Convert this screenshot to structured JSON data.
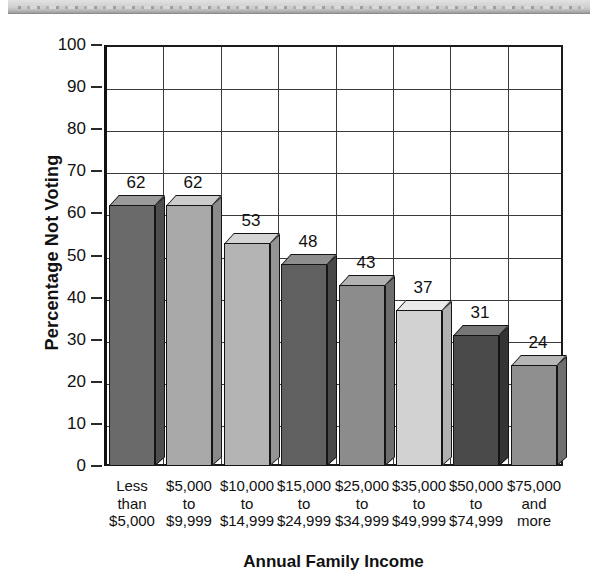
{
  "page": {
    "banner_name": "scan-artifact-banner"
  },
  "chart_data": {
    "type": "bar",
    "title": "",
    "xlabel": "Annual Family Income",
    "ylabel": "Percentage Not Voting",
    "ylim": [
      0,
      100
    ],
    "ytick_step": 10,
    "grid": true,
    "legend": "none",
    "style": "3d-bar",
    "categories": [
      "Less than $5,000",
      "$5,000 to $9,999",
      "$10,000 to $14,999",
      "$15,000 to $24,999",
      "$25,000 to $34,999",
      "$35,000 to $49,999",
      "$50,000 to $74,999",
      "$75,000 and more"
    ],
    "category_lines": [
      [
        "Less",
        "than",
        "$5,000"
      ],
      [
        "$5,000",
        "to",
        "$9,999"
      ],
      [
        "$10,000",
        "to",
        "$14,999"
      ],
      [
        "$15,000",
        "to",
        "$24,999"
      ],
      [
        "$25,000",
        "to",
        "$34,999"
      ],
      [
        "$35,000",
        "to",
        "$49,999"
      ],
      [
        "$50,000",
        "to",
        "$74,999"
      ],
      [
        "$75,000",
        "and",
        "more"
      ]
    ],
    "values": [
      62,
      62,
      53,
      48,
      43,
      37,
      31,
      24
    ],
    "value_labels": [
      "62",
      "62",
      "53",
      "48",
      "43",
      "37",
      "31",
      "24"
    ],
    "ytick_labels": [
      "0",
      "10",
      "20",
      "30",
      "40",
      "50",
      "60",
      "70",
      "80",
      "90",
      "100"
    ],
    "bar_colors": [
      "#6a6a6a",
      "#a8a8a8",
      "#b4b4b4",
      "#606060",
      "#8c8c8c",
      "#d2d2d2",
      "#4a4a4a",
      "#8f8f8f"
    ],
    "bar_top_colors": [
      "#9a9a9a",
      "#cccccc",
      "#d4d4d4",
      "#8e8e8e",
      "#b2b2b2",
      "#ebebeb",
      "#777777",
      "#b6b6b6"
    ],
    "bar_side_colors": [
      "#4e4e4e",
      "#8a8a8a",
      "#949494",
      "#484848",
      "#6e6e6e",
      "#b0b0b0",
      "#343434",
      "#6f6f6f"
    ],
    "axis_color": "#1b1b1b",
    "text_color": "#111111"
  }
}
